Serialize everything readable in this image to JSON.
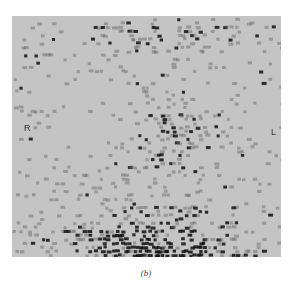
{
  "figure": {
    "panel_label": "(b)",
    "orientation": {
      "right": "R",
      "left": "L"
    },
    "image_type": "scintigram",
    "colors": {
      "background": "#c4c4c4",
      "dot_dark": "#111111",
      "dot_mid": "#6a6a6a",
      "page": "#ffffff"
    }
  }
}
